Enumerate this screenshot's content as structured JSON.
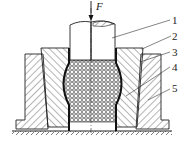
{
  "diagram": {
    "type": "cross-section",
    "force_label": "F",
    "parts": [
      {
        "id": "1",
        "label": "1",
        "name": "punch"
      },
      {
        "id": "2",
        "label": "2",
        "name": "die insert"
      },
      {
        "id": "3",
        "label": "3",
        "name": "elastic medium"
      },
      {
        "id": "4",
        "label": "4",
        "name": "tube workpiece"
      },
      {
        "id": "5",
        "label": "5",
        "name": "die ring"
      }
    ],
    "colors": {
      "line": "#1a1a1a",
      "hatch": "#333333",
      "background": "#ffffff"
    }
  }
}
